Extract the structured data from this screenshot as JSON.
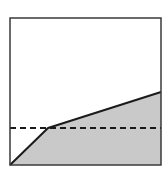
{
  "diagram": {
    "frame": {
      "x": 10,
      "y": 18,
      "width": 151,
      "height": 147,
      "stroke": "#3a3a3a"
    },
    "shaded_region": {
      "points": [
        [
          10,
          165
        ],
        [
          48,
          128
        ],
        [
          161,
          92
        ],
        [
          161,
          165
        ]
      ],
      "fill": "#c9c9c9"
    },
    "solid_line": {
      "points": [
        [
          10,
          165
        ],
        [
          48,
          128
        ],
        [
          161,
          92
        ]
      ],
      "stroke": "#1a1a1a"
    },
    "dashed_line": {
      "x1": 10,
      "y1": 128,
      "x2": 161,
      "y2": 128,
      "stroke": "#1a1a1a",
      "dasharray": "6,4"
    }
  }
}
